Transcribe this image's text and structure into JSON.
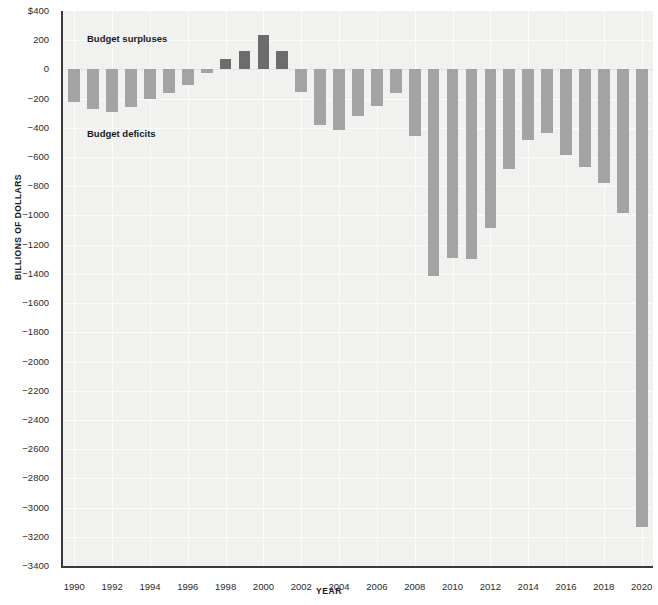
{
  "chart_data": {
    "type": "bar",
    "title": "",
    "subtitle": "",
    "xlabel": "YEAR",
    "ylabel": "BILLIONS OF DOLLARS",
    "ylim": [
      -3400,
      400
    ],
    "xlim": [
      1989.4,
      2020.6
    ],
    "grid": true,
    "legend": "none",
    "y_tick_labels": [
      "$400",
      "200",
      "0",
      "−200",
      "−400",
      "−600",
      "−800",
      "−1000",
      "−1200",
      "−1400",
      "−1600",
      "−1800",
      "−2000",
      "−2200",
      "−2400",
      "−2600",
      "−2800",
      "−3000",
      "−3200",
      "−3400"
    ],
    "y_tick_values": [
      400,
      200,
      0,
      -200,
      -400,
      -600,
      -800,
      -1000,
      -1200,
      -1400,
      -1600,
      -1800,
      -2000,
      -2200,
      -2400,
      -2600,
      -2800,
      -3000,
      -3200,
      -3400
    ],
    "x_tick_labels": [
      "1990",
      "1992",
      "1994",
      "1996",
      "1998",
      "2000",
      "2002",
      "2004",
      "2006",
      "2008",
      "2010",
      "2012",
      "2014",
      "2016",
      "2018",
      "2020"
    ],
    "x_tick_values": [
      1990,
      1992,
      1994,
      1996,
      1998,
      2000,
      2002,
      2004,
      2006,
      2008,
      2010,
      2012,
      2014,
      2016,
      2018,
      2020
    ],
    "categories": [
      1990,
      1991,
      1992,
      1993,
      1994,
      1995,
      1996,
      1997,
      1998,
      1999,
      2000,
      2001,
      2002,
      2003,
      2004,
      2005,
      2006,
      2007,
      2008,
      2009,
      2010,
      2011,
      2012,
      2013,
      2014,
      2015,
      2016,
      2017,
      2018,
      2019,
      2020
    ],
    "values": [
      -221,
      -269,
      -290,
      -255,
      -203,
      -164,
      -107,
      -22,
      69,
      126,
      236,
      128,
      -158,
      -378,
      -413,
      -318,
      -248,
      -161,
      -459,
      -1413,
      -1294,
      -1300,
      -1087,
      -680,
      -485,
      -438,
      -585,
      -665,
      -779,
      -984,
      -3132
    ],
    "annotations": [
      {
        "id": "surplus",
        "text": "Budget surpluses",
        "x": 1991.2,
        "y": 320
      },
      {
        "id": "deficit",
        "text": "Budget deficits",
        "x": 1991.2,
        "y": -370
      }
    ],
    "colors": {
      "deficit_bar": "#a3a3a3",
      "surplus_bar": "#6c6c6c",
      "plot_background": "#f1f1ef",
      "gridline": "#fbfbfa",
      "axis_line": "#3a3a3a",
      "text": "#1a1a1a",
      "page_background": "#ffffff"
    }
  }
}
